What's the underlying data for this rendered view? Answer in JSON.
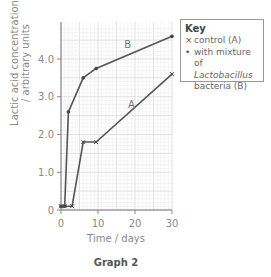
{
  "chart_data": {
    "type": "line",
    "title": "Graph 2",
    "xlabel": "Time / days",
    "ylabel": [
      "Lactic acid concentration",
      "/ arbitrary units"
    ],
    "xlim": [
      0,
      30
    ],
    "ylim": [
      0,
      4.8
    ],
    "xticks": [
      0,
      10,
      20,
      30
    ],
    "xtick_labels": [
      "0",
      "10",
      "20",
      "30"
    ],
    "yticks": [
      0,
      1.0,
      2.0,
      3.0,
      4.0
    ],
    "ytick_labels": [
      "0",
      "1.0",
      "2.0",
      "3.0",
      "4.0"
    ],
    "grid": true,
    "legend_position": "top-right, outside plot",
    "series": [
      {
        "name": "control (A)",
        "label": "A",
        "marker": "x",
        "x": [
          0,
          1,
          3,
          6,
          9.5,
          30
        ],
        "y": [
          0.1,
          0.1,
          0.1,
          1.8,
          1.8,
          3.6
        ]
      },
      {
        "name": "with mixture of Lactobacillus bacteria (B)",
        "label": "B",
        "marker": "dot",
        "x": [
          0,
          1,
          2,
          6,
          9.5,
          30
        ],
        "y": [
          0.1,
          0.1,
          2.6,
          3.5,
          3.75,
          4.6
        ]
      }
    ]
  },
  "key": {
    "title": "Key",
    "items": [
      {
        "symbol": "×",
        "text": "control (A)"
      },
      {
        "symbol": "•",
        "text_line1": "with mixture of",
        "text_italic": "Lactobacillus",
        "text_line3": "bacteria (B)"
      }
    ]
  },
  "axes": {
    "ylabel_line1": "Lactic acid concentration",
    "ylabel_line2": "/ arbitrary units",
    "xlabel": "Time / days"
  },
  "caption": "Graph 2"
}
